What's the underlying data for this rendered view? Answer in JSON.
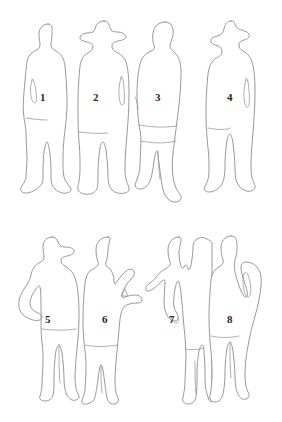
{
  "page": {
    "background_color": "#ffffff",
    "line_color": "#8c8c8c",
    "label_color": "#262626",
    "width": 282,
    "height": 422,
    "rows": 2,
    "columns": 4,
    "total_figures": 8
  },
  "figures": [
    {
      "id": "figure-1",
      "label": "1",
      "row": 1,
      "column": 1,
      "description": "standing man in long coat, bare head, arms at sides, feet splayed outward",
      "headwear": "none",
      "pose": "standing frontal",
      "label_x": 43,
      "label_y": 98
    },
    {
      "id": "figure-2",
      "label": "2",
      "row": 1,
      "column": 2,
      "description": "standing man in long overcoat wearing a wide-brimmed hat",
      "headwear": "wide-brimmed hat",
      "pose": "standing frontal",
      "label_x": 96,
      "label_y": 98
    },
    {
      "id": "figure-3",
      "label": "3",
      "row": 1,
      "column": 3,
      "description": "walking woman in coat and skirt, hair volume, legs mid-stride",
      "headwear": "none",
      "pose": "walking",
      "label_x": 158,
      "label_y": 98
    },
    {
      "id": "figure-4",
      "label": "4",
      "row": 1,
      "column": 4,
      "description": "standing man in long coat wearing a peaked cap, arm with visible hand",
      "headwear": "peaked cap",
      "pose": "standing frontal",
      "label_x": 230,
      "label_y": 98
    },
    {
      "id": "figure-5",
      "label": "5",
      "row": 2,
      "column": 1,
      "description": "standing man in baseball cap with left hand on hip, legs apart",
      "headwear": "baseball cap",
      "pose": "hand on hip",
      "label_x": 48,
      "label_y": 320
    },
    {
      "id": "figure-6",
      "label": "6",
      "row": 2,
      "column": 2,
      "description": "standing person with arm extended to the right, holding hands with figure 7",
      "headwear": "none",
      "pose": "holding hands",
      "label_x": 105,
      "label_y": 320
    },
    {
      "id": "figure-7",
      "label": "7",
      "row": 2,
      "column": 3,
      "description": "standing person in coat with arm extended to the left, holding hands with figure 6",
      "headwear": "none",
      "pose": "holding hands",
      "label_x": 172,
      "label_y": 320
    },
    {
      "id": "figure-8",
      "label": "8",
      "row": 2,
      "column": 4,
      "description": "standing man in long coat with hand in pocket, three-quarter view",
      "headwear": "none",
      "pose": "hand in pocket",
      "label_x": 230,
      "label_y": 320
    }
  ]
}
